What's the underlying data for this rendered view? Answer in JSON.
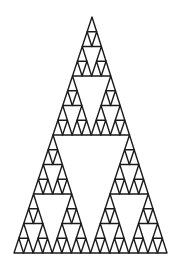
{
  "figure": {
    "type": "sierpinski-triangle",
    "depth": 4,
    "apex": [
      92,
      17
    ],
    "base_left": [
      14,
      253
    ],
    "base_right": [
      167,
      253
    ],
    "stroke_color": "#1a1a1a",
    "background_color": "#ffffff",
    "stroke_width": 1.4
  }
}
